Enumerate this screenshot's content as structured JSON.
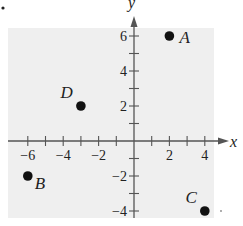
{
  "chart_data": {
    "type": "scatter",
    "title": "",
    "xlabel": "x",
    "ylabel": "y",
    "xlim": [
      -6.9,
      4.8
    ],
    "ylim": [
      -4.5,
      7
    ],
    "grid": false,
    "legend": null,
    "x_ticks": [
      -6,
      -5,
      -4,
      -3,
      -2,
      -1,
      1,
      2,
      3,
      4
    ],
    "x_tick_labels": [
      {
        "value": -6,
        "label": "−6"
      },
      {
        "value": -4,
        "label": "−4"
      },
      {
        "value": -2,
        "label": "−2"
      },
      {
        "value": 2,
        "label": "2"
      },
      {
        "value": 4,
        "label": "4"
      }
    ],
    "y_ticks": [
      -4,
      -3,
      -2,
      -1,
      1,
      2,
      3,
      4,
      5,
      6
    ],
    "y_tick_labels": [
      {
        "value": 6,
        "label": "6"
      },
      {
        "value": 4,
        "label": "4"
      },
      {
        "value": 2,
        "label": "2"
      },
      {
        "value": -2,
        "label": "−2"
      },
      {
        "value": -4,
        "label": "−4"
      }
    ],
    "points": [
      {
        "label": "A",
        "x": 2,
        "y": 6,
        "label_pos": "right"
      },
      {
        "label": "B",
        "x": -6,
        "y": -2,
        "label_pos": "below-right"
      },
      {
        "label": "C",
        "x": 4,
        "y": -4,
        "label_pos": "above-left"
      },
      {
        "label": "D",
        "x": -3,
        "y": 2,
        "label_pos": "above-left"
      }
    ]
  },
  "style": {
    "background_shade": "#efefef",
    "axis_color": "#555555",
    "point_color": "#111111",
    "text_color": "#222222"
  }
}
